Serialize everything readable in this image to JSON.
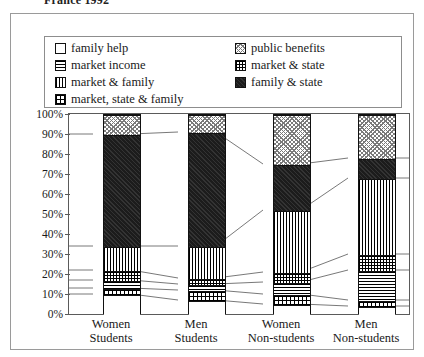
{
  "chart_title": "France 1992",
  "legend": {
    "left_column": [
      {
        "label": "family help",
        "pattern": "family-help",
        "swatch": "empty-white-square"
      },
      {
        "label": "market income",
        "pattern": "market-income",
        "swatch": "horizontal-lines-square"
      },
      {
        "label": "market & family",
        "pattern": "market-family",
        "swatch": "vertical-lines-square"
      },
      {
        "label": "market, state & family",
        "pattern": "market-state-family",
        "swatch": "fine-dotted-square"
      }
    ],
    "right_column": [
      {
        "label": "public benefits",
        "pattern": "public-benefits",
        "swatch": "cross-hatch-light-square"
      },
      {
        "label": "market & state",
        "pattern": "market-state",
        "swatch": "dense-grid-square"
      },
      {
        "label": "family & state",
        "pattern": "family-state",
        "swatch": "solid-black-square"
      }
    ]
  },
  "chart_data": {
    "type": "bar",
    "stacked": true,
    "normalized": true,
    "title": "France 1992",
    "xlabel": "",
    "ylabel": "",
    "ylim": [
      0,
      100
    ],
    "grid": false,
    "legend_position": "top",
    "categories": [
      "Women Students",
      "Men Students",
      "Women Non-students",
      "Men Non-students"
    ],
    "category_lines": [
      [
        "Women",
        "Students"
      ],
      [
        "Men",
        "Students"
      ],
      [
        "Women",
        "Non-students"
      ],
      [
        "Men",
        "Non-students"
      ]
    ],
    "ytick_labels": [
      "100%",
      "90%",
      "80%",
      "70%",
      "60%",
      "50%",
      "40%",
      "30%",
      "20%",
      "10%",
      "0%"
    ],
    "ytick_values": [
      100,
      90,
      80,
      70,
      60,
      50,
      40,
      30,
      20,
      10,
      0
    ],
    "series": [
      {
        "name": "family help",
        "pattern": "family-help",
        "values": [
          10,
          7,
          5,
          4
        ]
      },
      {
        "name": "market, state & family",
        "pattern": "market-state-family",
        "values": [
          3,
          5,
          5,
          3
        ]
      },
      {
        "name": "market income",
        "pattern": "market-income",
        "values": [
          4,
          3,
          6,
          15
        ]
      },
      {
        "name": "market & state",
        "pattern": "market-state",
        "values": [
          5,
          3,
          5,
          8
        ]
      },
      {
        "name": "market & family",
        "pattern": "market-family",
        "values": [
          12,
          16,
          31,
          38
        ]
      },
      {
        "name": "family & state",
        "pattern": "family-state",
        "values": [
          56,
          57,
          23,
          10
        ]
      },
      {
        "name": "public benefits",
        "pattern": "public-benefits",
        "values": [
          10,
          9,
          25,
          22
        ]
      }
    ]
  }
}
